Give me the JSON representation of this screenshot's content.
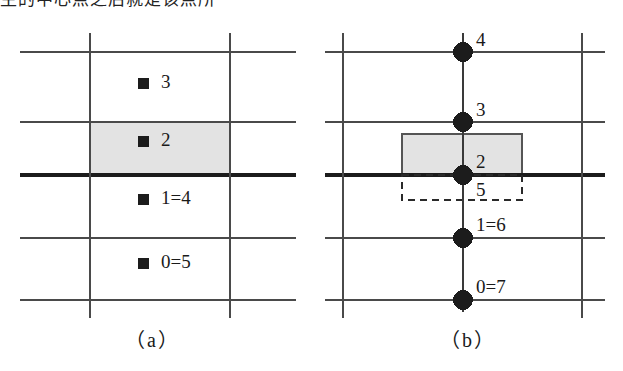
{
  "figure": {
    "top_text_clipped": "主的中心点之后就是该点所",
    "canvas": {
      "width": 623,
      "height": 371
    },
    "colors": {
      "ink": "#1a1a1a",
      "grid_thin": "#4a4a4a",
      "grid_thick": "#1c1c1c",
      "shaded_fill": "#e3e3e3",
      "shaded_stroke": "#555555",
      "dashed_stroke": "#2a2a2a",
      "background": "#ffffff"
    }
  },
  "panel_a": {
    "caption": "（a）",
    "marker_icon": "filled-square-marker",
    "items": [
      {
        "label": "3",
        "marker_x": 138,
        "marker_y": 84,
        "text_x": 160,
        "text_y": 76
      },
      {
        "label": "2",
        "marker_x": 138,
        "marker_y": 142,
        "text_x": 160,
        "text_y": 134
      },
      {
        "label": "1=4",
        "marker_x": 138,
        "marker_y": 200,
        "text_x": 160,
        "text_y": 192
      },
      {
        "label": "0=5",
        "marker_x": 138,
        "marker_y": 264,
        "text_x": 160,
        "text_y": 256
      }
    ],
    "grid": {
      "horizontal_y": [
        52,
        122,
        175,
        238,
        300
      ],
      "thick_line_y": 175,
      "vertical_x": [
        90,
        230
      ],
      "h_line_x_start": 20,
      "h_line_x_end": 296,
      "v_line_y_start": 33,
      "v_line_y_end": 318
    },
    "shaded_rect": {
      "x": 90,
      "y": 122,
      "width": 140,
      "height": 53
    }
  },
  "panel_b": {
    "caption": "（b）",
    "marker_icon": "filled-circle-node",
    "nodes": [
      {
        "label": "4",
        "cx": 463,
        "cy": 52,
        "text_x": 475,
        "text_y": 32
      },
      {
        "label": "3",
        "cx": 463,
        "cy": 122,
        "text_x": 475,
        "text_y": 102
      },
      {
        "label": "2",
        "cx": 463,
        "cy": 175,
        "text_x": 475,
        "text_y": 154
      },
      {
        "label": "5",
        "cx": null,
        "cy": null,
        "text_x": 475,
        "text_y": 181
      },
      {
        "label": "1=6",
        "cx": 463,
        "cy": 238,
        "text_x": 475,
        "text_y": 217
      },
      {
        "label": "0=7",
        "cx": 463,
        "cy": 300,
        "text_x": 475,
        "text_y": 279
      }
    ],
    "node_radius": 10,
    "grid": {
      "horizontal_y": [
        52,
        122,
        175,
        238,
        300
      ],
      "thick_line_y": 175,
      "vertical_x": [
        343,
        582
      ],
      "center_axis_x": 463,
      "h_line_x_start": 325,
      "h_line_x_end": 605,
      "v_line_y_start": 33,
      "v_line_y_end": 318,
      "axis_y_start": 33,
      "axis_y_end": 312
    },
    "shaded_rect": {
      "x": 402,
      "y": 134,
      "width": 120,
      "height": 41
    },
    "dashed_rect": {
      "x": 402,
      "y": 175,
      "width": 120,
      "height": 25
    }
  },
  "captions": {
    "a": {
      "text": "（a）",
      "x": 125,
      "y": 330
    },
    "b": {
      "text": "（b）",
      "x": 440,
      "y": 330
    }
  }
}
